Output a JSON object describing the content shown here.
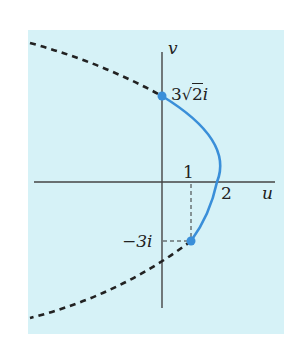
{
  "diagram": {
    "axes": {
      "horizontal_label": "u",
      "vertical_label": "v"
    },
    "ticks": {
      "u_one": "1",
      "u_two": "2"
    },
    "points": [
      {
        "label": "3√2i",
        "u": 0,
        "v": 4.243
      },
      {
        "label": "−3i",
        "u": 1,
        "v": -3
      }
    ],
    "label_top_coefficient": "3",
    "label_top_radicand": "2",
    "label_top_suffix": "i",
    "label_bottom": "−3i",
    "curve": {
      "equation": "u = 2 − v²/9",
      "solid_segment": "from −3i to 3√2i",
      "dashed_segments": "extensions beyond endpoints"
    },
    "colors": {
      "background": "#d6f2f7",
      "curve": "#3a8fd9",
      "dashed": "#222222",
      "axes": "#444444"
    }
  }
}
